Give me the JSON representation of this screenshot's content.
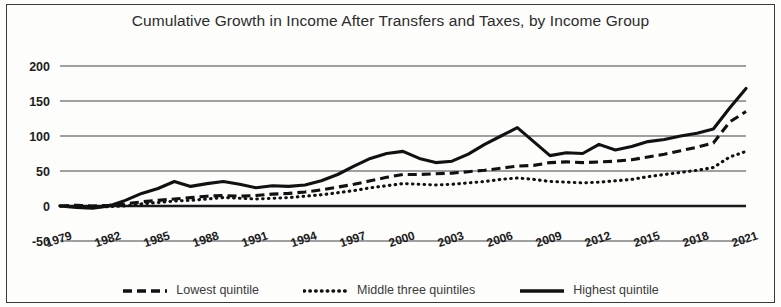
{
  "chart_data": {
    "type": "line",
    "title": "Cumulative Growth in Income After Transfers and Taxes, by Income Group",
    "xlabel": "",
    "ylabel": "",
    "ylim": [
      -50,
      200
    ],
    "yticks": [
      200,
      150,
      100,
      50,
      0,
      -50
    ],
    "ytick_labels": [
      "200",
      "150",
      "100",
      "50",
      "0",
      "-50"
    ],
    "grid": true,
    "legend_position": "bottom",
    "x": [
      1979,
      1980,
      1981,
      1982,
      1983,
      1984,
      1985,
      1986,
      1987,
      1988,
      1989,
      1990,
      1991,
      1992,
      1993,
      1994,
      1995,
      1996,
      1997,
      1998,
      1999,
      2000,
      2001,
      2002,
      2003,
      2004,
      2005,
      2006,
      2007,
      2008,
      2009,
      2010,
      2011,
      2012,
      2013,
      2014,
      2015,
      2016,
      2017,
      2018,
      2019,
      2020,
      2021
    ],
    "xtick_labels": [
      "1979",
      "1982",
      "1985",
      "1988",
      "1991",
      "1994",
      "1997",
      "2000",
      "2003",
      "2006",
      "2009",
      "2012",
      "2015",
      "2018",
      "2021"
    ],
    "xticks": [
      1979,
      1982,
      1985,
      1988,
      1991,
      1994,
      1997,
      2000,
      2003,
      2006,
      2009,
      2012,
      2015,
      2018,
      2021
    ],
    "series": [
      {
        "name": "Lowest quintile",
        "style": "dashed",
        "values": [
          0,
          1,
          0,
          1,
          3,
          6,
          8,
          10,
          12,
          14,
          15,
          14,
          15,
          17,
          18,
          20,
          23,
          27,
          31,
          36,
          41,
          45,
          45,
          46,
          47,
          49,
          51,
          54,
          57,
          58,
          62,
          63,
          62,
          63,
          64,
          66,
          70,
          74,
          79,
          84,
          90,
          120,
          135
        ]
      },
      {
        "name": "Middle three quintiles",
        "style": "dotted",
        "values": [
          0,
          -1,
          -1,
          -1,
          0,
          3,
          5,
          7,
          8,
          10,
          12,
          11,
          10,
          11,
          12,
          14,
          16,
          19,
          22,
          26,
          29,
          32,
          31,
          30,
          31,
          33,
          35,
          38,
          40,
          38,
          35,
          34,
          33,
          34,
          36,
          38,
          42,
          45,
          48,
          51,
          55,
          70,
          78
        ]
      },
      {
        "name": "Highest quintile",
        "style": "solid",
        "values": [
          0,
          -2,
          -3,
          0,
          8,
          18,
          25,
          35,
          28,
          32,
          35,
          31,
          26,
          29,
          28,
          30,
          36,
          45,
          57,
          68,
          75,
          78,
          68,
          62,
          64,
          74,
          88,
          100,
          112,
          92,
          72,
          76,
          75,
          88,
          80,
          85,
          92,
          95,
          100,
          104,
          110,
          140,
          168
        ]
      }
    ]
  },
  "legend": {
    "items": [
      {
        "label": "Lowest quintile",
        "style": "dashed"
      },
      {
        "label": "Middle three quintiles",
        "style": "dotted"
      },
      {
        "label": "Highest quintile",
        "style": "solid"
      }
    ]
  },
  "colors": {
    "line": "#111111",
    "grid": "#444444",
    "text": "#2c2c2c",
    "background": "#fdfdfc"
  }
}
